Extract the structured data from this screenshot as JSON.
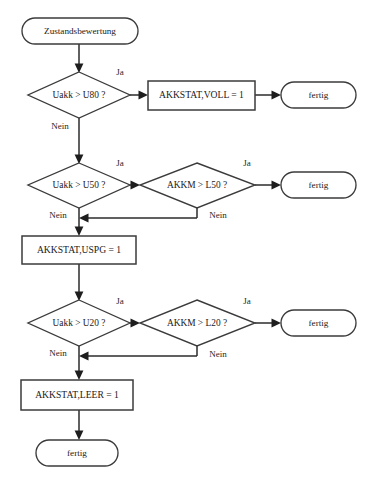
{
  "diagram": {
    "title": "Zustandsbewertung",
    "type": "flowchart",
    "language": "de",
    "canvas": {
      "width": 376,
      "height": 486,
      "background": "#ffffff"
    },
    "colors": {
      "stroke": "#3b3b3b",
      "line": "#2b2b2b",
      "text": "#1a1a1a",
      "fill": "#ffffff"
    },
    "nodes": [
      {
        "id": "start",
        "shape": "stadium",
        "label": "Zustandsbewertung"
      },
      {
        "id": "dec_u80",
        "shape": "diamond",
        "label": "Uakk > U80 ?"
      },
      {
        "id": "set_voll",
        "shape": "rectangle",
        "label": "AKKSTAT,VOLL = 1"
      },
      {
        "id": "end_voll",
        "shape": "stadium",
        "label": "fertig"
      },
      {
        "id": "dec_u50",
        "shape": "diamond",
        "label": "Uakk > U50 ?"
      },
      {
        "id": "dec_l50",
        "shape": "diamond",
        "label": "AKKM > L50 ?"
      },
      {
        "id": "end_l50",
        "shape": "stadium",
        "label": "fertig"
      },
      {
        "id": "set_uspg",
        "shape": "rectangle",
        "label": "AKKSTAT,USPG = 1"
      },
      {
        "id": "dec_u20",
        "shape": "diamond",
        "label": "Uakk > U20 ?"
      },
      {
        "id": "dec_l20",
        "shape": "diamond",
        "label": "AKKM > L20 ?"
      },
      {
        "id": "end_l20",
        "shape": "stadium",
        "label": "fertig"
      },
      {
        "id": "set_leer",
        "shape": "rectangle",
        "label": "AKKSTAT,LEER = 1"
      },
      {
        "id": "end_leer",
        "shape": "stadium",
        "label": "fertig"
      }
    ],
    "edge_labels": {
      "ja_u80": "Ja",
      "nein_u80": "Nein",
      "ja_u50": "Ja",
      "nein_u50": "Nein",
      "ja_l50": "Ja",
      "nein_l50": "Nein",
      "ja_u20": "Ja",
      "nein_u20": "Nein",
      "ja_l20": "Ja",
      "nein_l20": "Nein"
    }
  }
}
